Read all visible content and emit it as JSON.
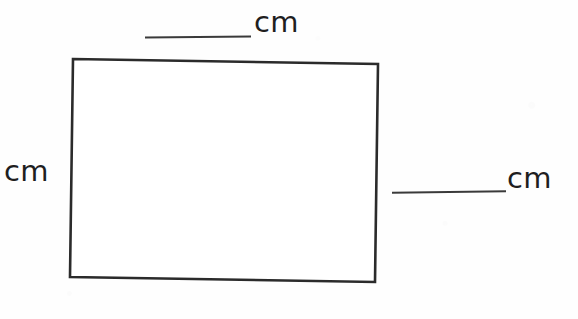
{
  "figure": {
    "type": "rectangle-measurement-worksheet",
    "shape_name": "rectangle",
    "stroke_color": "#2b2b2b",
    "background_color": "#ffffff",
    "corners": {
      "top_left": [
        73,
        59
      ],
      "top_right": [
        378,
        64
      ],
      "bottom_right": [
        375,
        282
      ],
      "bottom_left": [
        70,
        277
      ]
    }
  },
  "labels": {
    "top": {
      "unit": "cm",
      "has_blank": true,
      "blank_value": ""
    },
    "left": {
      "unit": "cm",
      "has_blank": false,
      "blank_value": ""
    },
    "right": {
      "unit": "cm",
      "has_blank": true,
      "blank_value": ""
    }
  }
}
